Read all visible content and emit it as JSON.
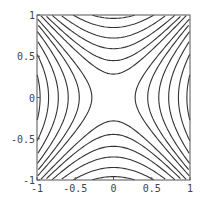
{
  "chart_data": {
    "type": "contour",
    "function": "x^2 - y^2",
    "title": "",
    "xlabel": "",
    "ylabel": "",
    "xlim": [
      -1,
      1
    ],
    "ylim": [
      -1,
      1
    ],
    "grid": false,
    "legend": null,
    "x_ticks": [
      -1,
      -0.5,
      0,
      0.5,
      1
    ],
    "y_ticks": [
      -1,
      -0.5,
      0,
      0.5,
      1
    ],
    "x_tick_labels": [
      "-1",
      "-0.5",
      "0",
      "0.5",
      "1"
    ],
    "y_tick_labels": [
      "-1",
      "-0.5",
      "0",
      "0.5",
      "1"
    ],
    "contour_levels_positive": [
      0.08,
      0.2,
      0.35,
      0.52,
      0.72,
      0.92
    ],
    "contour_levels_negative": [
      -0.08,
      -0.2,
      -0.35,
      -0.52,
      -0.72,
      -0.92
    ],
    "line_color": "#333333",
    "frame_color": "#555555"
  }
}
